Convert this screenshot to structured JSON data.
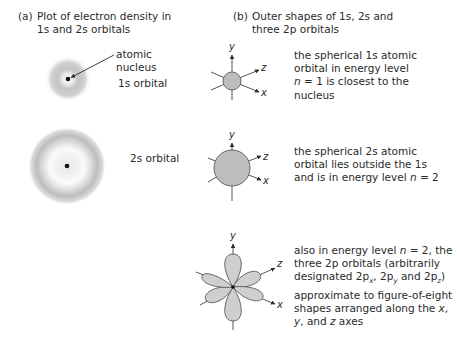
{
  "panel_a": {
    "heading_tag": "(a)",
    "heading_line1": "Plot of electron density in",
    "heading_line2": "1s and 2s orbitals",
    "nucleus_label_line1": "atomic",
    "nucleus_label_line2": "nucleus",
    "orbital_1s_label": "1s orbital",
    "orbital_2s_label": "2s orbital"
  },
  "panel_b": {
    "heading_tag": "(b)",
    "heading_line1": "Outer shapes of 1s, 2s and",
    "heading_line2": "three 2p orbitals",
    "axes": {
      "y": "y",
      "z": "z",
      "x": "x"
    },
    "desc_1s": {
      "line1": "the spherical 1s atomic",
      "line2": "orbital in energy level",
      "line3_var": "n",
      "line3_rest": " = 1 is closest to the",
      "line4": "nucleus"
    },
    "desc_2s": {
      "line1": "the spherical 2s atomic",
      "line2": "orbital lies outside the 1s",
      "line3_pre": "and is in energy level ",
      "line3_var": "n",
      "line3_post": " = 2"
    },
    "desc_2p": {
      "line1_pre": "also in energy level ",
      "line1_var": "n",
      "line1_post": " = 2, the",
      "line2": "three 2p orbitals (arbitrarily",
      "line3_pre": "designated 2p",
      "sub_x": "x",
      "sep1": ", 2p",
      "sub_y": "y",
      "sep2": " and 2p",
      "sub_z": "z",
      "line3_post": ")",
      "line4": "approximate to figure-of-eight",
      "line5_pre": "shapes arranged along the ",
      "line5_var": "x",
      "line5_post": ",",
      "line6_var1": "y",
      "line6_mid": ", and ",
      "line6_var2": "z",
      "line6_post": " axes"
    }
  },
  "colors": {
    "text": "#2a2a2a",
    "orbital_fill": "#bdbdbd",
    "lobe_fill": "#cfcfcf",
    "outline": "#5a5a5a",
    "density": "#9a9a9a"
  }
}
